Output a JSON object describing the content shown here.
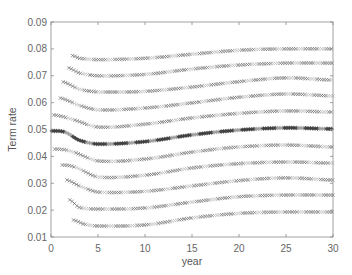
{
  "chart_data": {
    "type": "scatter",
    "title": "",
    "xlabel": "year",
    "ylabel": "Term rate",
    "xlim": [
      0,
      30
    ],
    "ylim": [
      0.01,
      0.09
    ],
    "xticks": [
      0,
      5,
      10,
      15,
      20,
      25,
      30
    ],
    "xtick_labels": [
      "0",
      "5",
      "10",
      "15",
      "20",
      "25",
      "30"
    ],
    "yticks": [
      0.01,
      0.02,
      0.03,
      0.04,
      0.05,
      0.06,
      0.07,
      0.08,
      0.09
    ],
    "ytick_labels": [
      "0.01",
      "0.02",
      "0.03",
      "0.04",
      "0.05",
      "0.06",
      "0.07",
      "0.08",
      "0.09"
    ],
    "grid": false,
    "legend": null,
    "marker_note": "Dense 'x' markers for all curves except the middle curve which uses '*' (darker)",
    "series": [
      {
        "name": "curve-1",
        "marker": "x",
        "x": [
          2.3,
          3,
          5,
          10,
          15,
          20,
          25,
          30
        ],
        "y": [
          0.0775,
          0.0765,
          0.076,
          0.0765,
          0.078,
          0.0795,
          0.08,
          0.08
        ]
      },
      {
        "name": "curve-2",
        "marker": "x",
        "x": [
          1.9,
          3,
          5,
          10,
          15,
          20,
          25,
          30
        ],
        "y": [
          0.0729,
          0.071,
          0.07,
          0.0705,
          0.0725,
          0.074,
          0.0747,
          0.0747
        ]
      },
      {
        "name": "curve-3",
        "marker": "x",
        "x": [
          1.3,
          3,
          5,
          10,
          15,
          20,
          25,
          30
        ],
        "y": [
          0.0677,
          0.065,
          0.064,
          0.0642,
          0.0658,
          0.0678,
          0.0692,
          0.0684
        ]
      },
      {
        "name": "curve-4",
        "marker": "x",
        "x": [
          1.0,
          3,
          5,
          10,
          15,
          20,
          25,
          30
        ],
        "y": [
          0.0617,
          0.059,
          0.0573,
          0.058,
          0.0599,
          0.062,
          0.0632,
          0.0625
        ]
      },
      {
        "name": "curve-5",
        "marker": "x",
        "x": [
          0.3,
          2,
          5,
          10,
          15,
          20,
          25,
          30
        ],
        "y": [
          0.0554,
          0.054,
          0.0509,
          0.052,
          0.0543,
          0.056,
          0.0569,
          0.0565
        ]
      },
      {
        "name": "curve-6",
        "marker": "*",
        "x": [
          0.1,
          1.5,
          3,
          5,
          10,
          15,
          20,
          25,
          30
        ],
        "y": [
          0.0495,
          0.049,
          0.046,
          0.0446,
          0.0455,
          0.048,
          0.0498,
          0.0506,
          0.0502
        ]
      },
      {
        "name": "curve-7",
        "marker": "x",
        "x": [
          0.4,
          2,
          5,
          10,
          15,
          20,
          25,
          30
        ],
        "y": [
          0.0427,
          0.042,
          0.0383,
          0.039,
          0.0416,
          0.0435,
          0.0442,
          0.0435
        ]
      },
      {
        "name": "curve-8",
        "marker": "x",
        "x": [
          1.2,
          2.5,
          5,
          10,
          15,
          20,
          25,
          30
        ],
        "y": [
          0.0368,
          0.036,
          0.0323,
          0.033,
          0.0357,
          0.0373,
          0.0379,
          0.0375
        ]
      },
      {
        "name": "curve-9",
        "marker": "x",
        "x": [
          1.7,
          3,
          5,
          10,
          15,
          20,
          25,
          30
        ],
        "y": [
          0.0312,
          0.029,
          0.0267,
          0.027,
          0.029,
          0.031,
          0.032,
          0.0312
        ]
      },
      {
        "name": "curve-10",
        "marker": "x",
        "x": [
          2.0,
          3,
          5,
          10,
          15,
          20,
          25,
          30
        ],
        "y": [
          0.0238,
          0.021,
          0.0204,
          0.0208,
          0.023,
          0.025,
          0.0256,
          0.0256
        ]
      },
      {
        "name": "curve-11",
        "marker": "x",
        "x": [
          2.4,
          3.5,
          5,
          10,
          15,
          20,
          25,
          30
        ],
        "y": [
          0.0163,
          0.0148,
          0.0141,
          0.0145,
          0.0171,
          0.0188,
          0.0193,
          0.0193
        ]
      }
    ]
  },
  "layout": {
    "plot_left": 51,
    "plot_right": 333,
    "plot_top": 22,
    "plot_bottom": 237,
    "colors": {
      "x_marker": "#6e6e6e",
      "x_marker_light": "#bdbdbd",
      "star_marker": "#3f3f3f",
      "axis": "#8a8a8a",
      "text": "#666666"
    }
  }
}
